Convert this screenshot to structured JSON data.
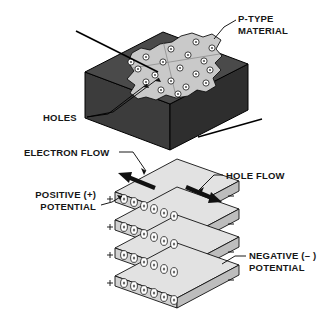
{
  "figure": {
    "background_color": "#ffffff"
  },
  "labels": {
    "p_type_line1": "P-TYPE",
    "p_type_line2": "MATERIAL",
    "holes": "HOLES",
    "electron_flow": "ELECTRON FLOW",
    "hole_flow": "HOLE FLOW",
    "positive_line1": "POSITIVE (+)",
    "positive_line2": "POTENTIAL",
    "negative_line1": "NEGATIVE (– )",
    "negative_line2": "POTENTIAL"
  },
  "polarity_marks": {
    "positive_symbol": "+",
    "negative_symbol": "–",
    "positive_count": 4,
    "negative_count": 4
  },
  "colors": {
    "block_front": "#3c3c3c",
    "block_top": "#4a4a4a",
    "block_side": "#2e2e2e",
    "blob_fill": "#c9c9c9",
    "slab_top": "#e2e2e2",
    "slab_front": "#d2d2d2",
    "slab_side": "#bdbdbd",
    "hole_fill": "#ffffff",
    "hole_core": "#555555",
    "arrow": "#111111",
    "outline": "#000000",
    "text": "#161616"
  },
  "top_block": {
    "name": "p-type-material-block",
    "hole_count": 19,
    "description": "Isometric dark block with light irregular region on top face containing holes"
  },
  "stack": {
    "name": "layered-crystal-stack",
    "layer_count": 4,
    "holes_per_layer": 6,
    "electron_flow_direction": "up-left",
    "hole_flow_direction": "down-right"
  }
}
